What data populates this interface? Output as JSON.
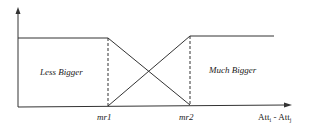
{
  "diagram": {
    "type": "fuzzy-membership-functions",
    "regions": {
      "left": "Less Bigger",
      "right": "Much Bigger"
    },
    "x_ticks": [
      "mr1",
      "mr2"
    ],
    "x_axis_label": {
      "base": "Att",
      "sub_i": "i",
      "separator": " - ",
      "sub_j": "j"
    },
    "colors": {
      "line": "#333333",
      "background": "#ffffff"
    }
  }
}
